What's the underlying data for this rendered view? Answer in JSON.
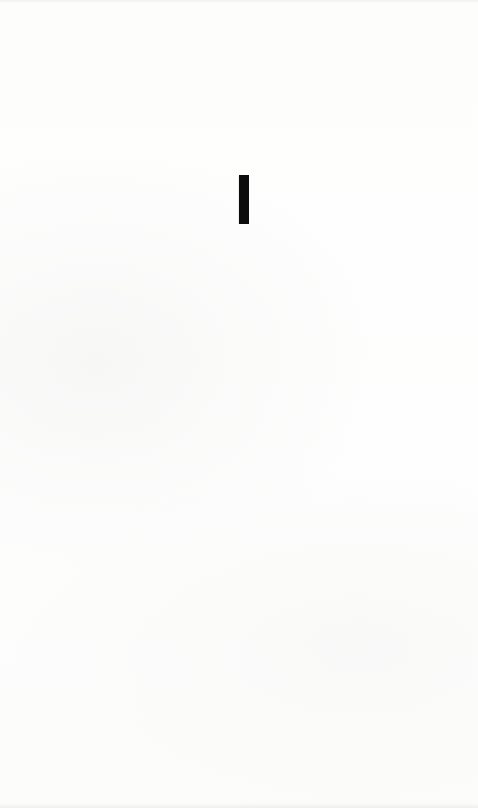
{
  "document": {
    "part_numeral": "I",
    "numeral_color": "#0c0c0c",
    "paper_color": "#fdfdfc"
  }
}
